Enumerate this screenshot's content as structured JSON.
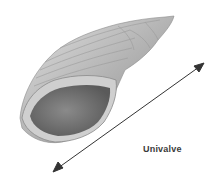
{
  "diagram": {
    "label": "Univalve",
    "colors": {
      "shell_light": "#d8d8d8",
      "shell_mid": "#a8a8a8",
      "shell_dark": "#6a6a6a",
      "aperture": "#707070",
      "arrow": "#333333",
      "label": "#3a3a3a"
    },
    "arrow": {
      "x1": 55,
      "y1": 170,
      "x2": 202,
      "y2": 65,
      "double_headed": true
    }
  }
}
